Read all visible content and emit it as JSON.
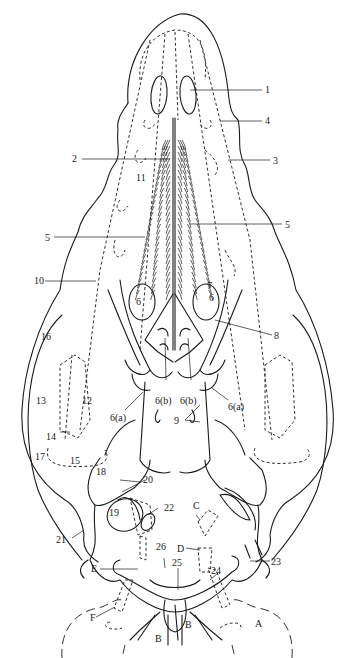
{
  "figure": {
    "labels": {
      "l1": "1",
      "l2": "2",
      "l3": "3",
      "l4": "4",
      "l5a": "5",
      "l5b": "5",
      "l6a": "6",
      "l6b": "6",
      "l6bL": "6(b)",
      "l6bR": "6(b)",
      "l6aL": "6(a)",
      "l6aR": "6(a)",
      "l7": "7",
      "l8": "8",
      "l9": "9",
      "l10": "10",
      "l11": "11",
      "l12": "12",
      "l13": "13",
      "l14": "14",
      "l15": "15",
      "l16": "16",
      "l17": "17",
      "l18": "18",
      "l19": "19",
      "l20": "20",
      "l21": "21",
      "l22": "22",
      "l23": "23",
      "l24": "24",
      "l25": "25",
      "l26": "26",
      "lA": "A",
      "lB1": "B",
      "lB2": "B",
      "lC": "C",
      "lD": "D",
      "lE": "E",
      "lF": "F"
    }
  }
}
